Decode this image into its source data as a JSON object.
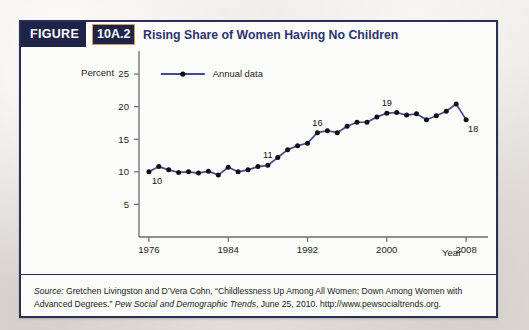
{
  "figure": {
    "badge_label": "FIGURE",
    "number": "10A.2",
    "title": "Rising Share of Women Having No Children",
    "badge_color": "#1e2448",
    "number_border_color": "#d89b52",
    "title_color": "#2b3570",
    "frame_color": "#2b2f55"
  },
  "source": {
    "label": "Source:",
    "text_part1": " Gretchen Livingston and D’Vera Cohn, “Childlessness Up Among All Women; Down Among Women with Advanced Degrees.” ",
    "publication": "Pew Social and Demographic Trends",
    "text_part2": ", June 25, 2010. http://www.pewsocialtrends.org."
  },
  "chart_data": {
    "type": "line",
    "title": "Rising Share of Women Having No Children",
    "xlabel": "Year",
    "ylabel": "Percent",
    "xlim": [
      1975,
      2009
    ],
    "ylim": [
      0,
      27
    ],
    "xticks": [
      1976,
      1984,
      1992,
      2000,
      2008
    ],
    "yticks": [
      5,
      10,
      15,
      20,
      25
    ],
    "grid": false,
    "legend_position": "top-left-inside",
    "line_color": "#414c94",
    "marker_color": "#111111",
    "series": [
      {
        "name": "Annual data",
        "x": [
          1976,
          1977,
          1978,
          1979,
          1980,
          1981,
          1982,
          1983,
          1984,
          1985,
          1986,
          1987,
          1988,
          1989,
          1990,
          1991,
          1992,
          1993,
          1994,
          1995,
          1996,
          1997,
          1998,
          1999,
          2000,
          2001,
          2002,
          2003,
          2004,
          2005,
          2006,
          2007,
          2008
        ],
        "values": [
          10.0,
          10.8,
          10.3,
          9.9,
          10.0,
          9.8,
          10.1,
          9.5,
          10.7,
          10.0,
          10.3,
          10.8,
          11.0,
          12.2,
          13.4,
          14.0,
          14.4,
          16.0,
          16.3,
          16.0,
          17.0,
          17.6,
          17.6,
          18.4,
          19.0,
          19.1,
          18.7,
          18.9,
          18.0,
          18.6,
          19.3,
          20.4,
          18.0
        ]
      }
    ],
    "point_labels": [
      {
        "x": 1976,
        "value": 10.0,
        "text": "10"
      },
      {
        "x": 1988,
        "value": 11.0,
        "text": "11"
      },
      {
        "x": 1993,
        "value": 16.0,
        "text": "16"
      },
      {
        "x": 2000,
        "value": 19.0,
        "text": "19"
      },
      {
        "x": 2008,
        "value": 18.0,
        "text": "18"
      }
    ]
  }
}
